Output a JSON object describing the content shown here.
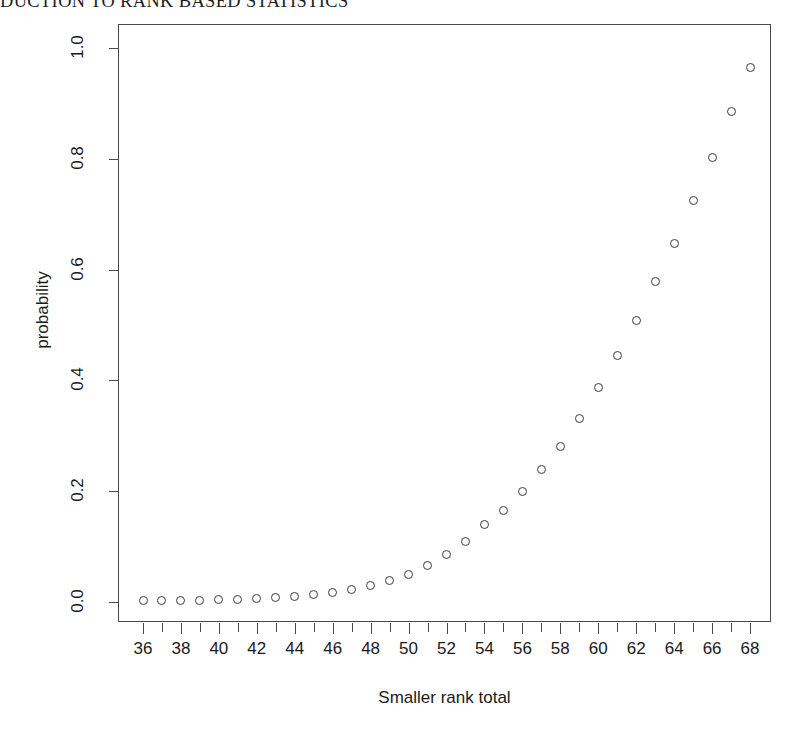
{
  "page": {
    "running_head": "DUCTION TO RANK BASED STATISTICS"
  },
  "chart_data": {
    "type": "scatter",
    "title": "",
    "xlabel": "Smaller rank total",
    "ylabel": "probability",
    "xlim": [
      35,
      69
    ],
    "ylim": [
      0.0,
      1.02
    ],
    "grid": false,
    "legend": null,
    "marker": "open-circle",
    "x_tick_labels": [
      "36",
      "38",
      "40",
      "42",
      "44",
      "46",
      "48",
      "50",
      "52",
      "54",
      "56",
      "58",
      "60",
      "62",
      "64",
      "66",
      "68"
    ],
    "x_tick_values": [
      36,
      38,
      40,
      42,
      44,
      46,
      48,
      50,
      52,
      54,
      56,
      58,
      60,
      62,
      64,
      66,
      68
    ],
    "x_minor_ticks": [
      36,
      37,
      38,
      39,
      40,
      41,
      42,
      43,
      44,
      45,
      46,
      47,
      48,
      49,
      50,
      51,
      52,
      53,
      54,
      55,
      56,
      57,
      58,
      59,
      60,
      61,
      62,
      63,
      64,
      65,
      66,
      67,
      68
    ],
    "y_tick_labels": [
      "0.0",
      "0.2",
      "0.4",
      "0.6",
      "0.8",
      "1.0"
    ],
    "y_tick_values": [
      0.0,
      0.2,
      0.4,
      0.6,
      0.8,
      1.0
    ],
    "x": [
      36,
      37,
      38,
      39,
      40,
      41,
      42,
      43,
      44,
      45,
      46,
      47,
      48,
      49,
      50,
      51,
      52,
      53,
      54,
      55,
      56,
      57,
      58,
      59,
      60,
      61,
      62,
      63,
      64,
      65,
      66,
      67,
      68
    ],
    "y": [
      0.002,
      0.002,
      0.003,
      0.003,
      0.004,
      0.005,
      0.006,
      0.008,
      0.01,
      0.013,
      0.017,
      0.022,
      0.029,
      0.038,
      0.05,
      0.065,
      0.085,
      0.11,
      0.14,
      0.165,
      0.2,
      0.24,
      0.28,
      0.332,
      0.388,
      0.445,
      0.508,
      0.578,
      0.648,
      0.725,
      0.802,
      0.885,
      0.965
    ],
    "series": [
      {
        "name": "probability",
        "points": [
          {
            "x": 36,
            "y": 0.002
          },
          {
            "x": 37,
            "y": 0.002
          },
          {
            "x": 38,
            "y": 0.003
          },
          {
            "x": 39,
            "y": 0.003
          },
          {
            "x": 40,
            "y": 0.004
          },
          {
            "x": 41,
            "y": 0.005
          },
          {
            "x": 42,
            "y": 0.006
          },
          {
            "x": 43,
            "y": 0.008
          },
          {
            "x": 44,
            "y": 0.01
          },
          {
            "x": 45,
            "y": 0.013
          },
          {
            "x": 46,
            "y": 0.017
          },
          {
            "x": 47,
            "y": 0.022
          },
          {
            "x": 48,
            "y": 0.029
          },
          {
            "x": 49,
            "y": 0.038
          },
          {
            "x": 50,
            "y": 0.05
          },
          {
            "x": 51,
            "y": 0.065
          },
          {
            "x": 52,
            "y": 0.085
          },
          {
            "x": 53,
            "y": 0.11
          },
          {
            "x": 54,
            "y": 0.14
          },
          {
            "x": 55,
            "y": 0.165
          },
          {
            "x": 56,
            "y": 0.2
          },
          {
            "x": 57,
            "y": 0.24
          },
          {
            "x": 58,
            "y": 0.28
          },
          {
            "x": 59,
            "y": 0.332
          },
          {
            "x": 60,
            "y": 0.388
          },
          {
            "x": 61,
            "y": 0.445
          },
          {
            "x": 62,
            "y": 0.508
          },
          {
            "x": 63,
            "y": 0.578
          },
          {
            "x": 64,
            "y": 0.648
          },
          {
            "x": 65,
            "y": 0.725
          },
          {
            "x": 66,
            "y": 0.802
          },
          {
            "x": 67,
            "y": 0.885
          },
          {
            "x": 68,
            "y": 0.965
          }
        ]
      }
    ],
    "colors": {
      "marker_stroke": "#3b3b3b",
      "axis": "#4a4a4a",
      "text": "#1a1a1a",
      "background": "#ffffff"
    }
  }
}
